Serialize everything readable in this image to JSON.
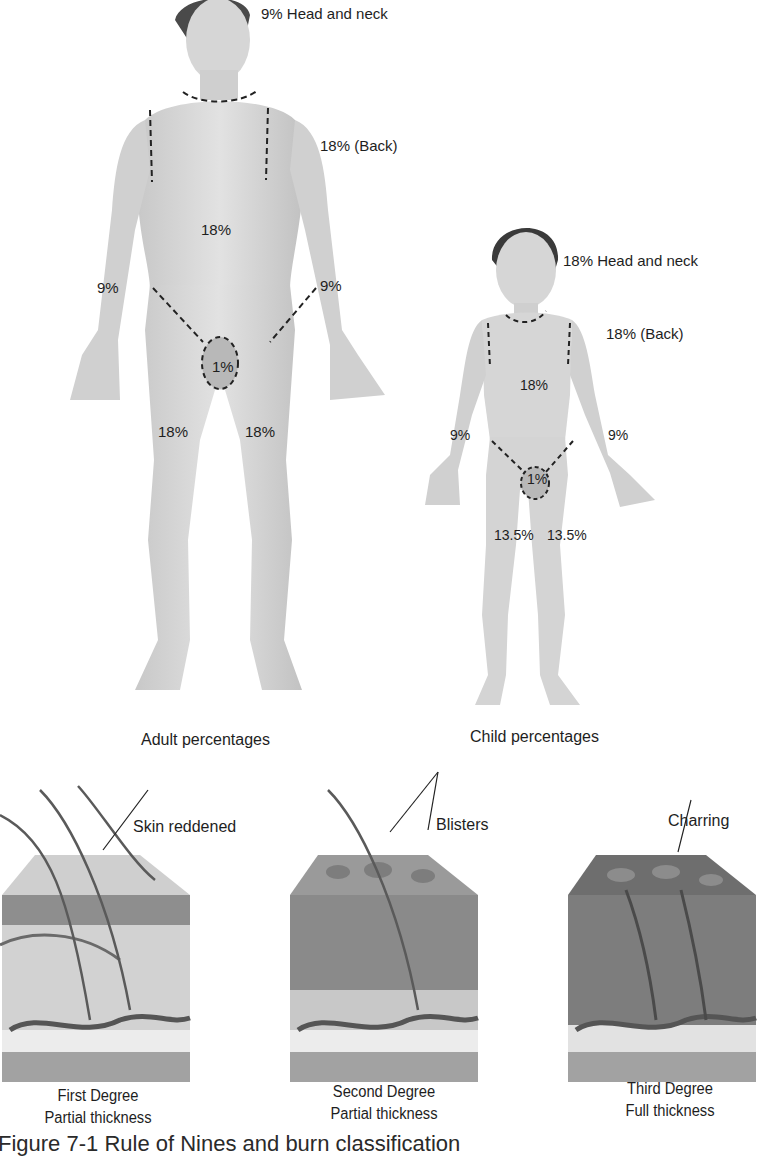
{
  "figure": {
    "caption": "Figure 7-1  Rule of Nines and burn classification"
  },
  "adult": {
    "title": "Adult percentages",
    "labels": {
      "head_neck": "9% Head and neck",
      "back": "18% (Back)",
      "torso_front": "18%",
      "arm_right": "9%",
      "arm_left": "9%",
      "genitals": "1%",
      "leg_right": "18%",
      "leg_left": "18%"
    }
  },
  "child": {
    "title": "Child percentages",
    "labels": {
      "head_neck": "18% Head and neck",
      "back": "18% (Back)",
      "torso_front": "18%",
      "arm_right": "9%",
      "arm_left": "9%",
      "genitals": "1%",
      "leg_right": "13.5%",
      "leg_left": "13.5%"
    }
  },
  "burns": [
    {
      "degree": "First Degree",
      "thickness": "Partial thickness",
      "callout": "Skin reddened"
    },
    {
      "degree": "Second Degree",
      "thickness": "Partial thickness",
      "callout": "Blisters"
    },
    {
      "degree": "Third Degree",
      "thickness": "Full thickness",
      "callout": "Charring"
    }
  ],
  "colors": {
    "skin_light": "#dcdcdc",
    "skin_mid": "#c4c4c4",
    "epidermis_1": "#b9b9b9",
    "epidermis_2": "#8e8e8e",
    "epidermis_3": "#6e6e6e",
    "dermis_1": "#cfcfcf",
    "dermis_2": "#a7a7a7",
    "dermis_3": "#8a8a8a",
    "fat": "#e8e8e8",
    "muscle": "#9a9a9a",
    "hair": "#5a5a5a",
    "text": "#1e1e1e"
  }
}
